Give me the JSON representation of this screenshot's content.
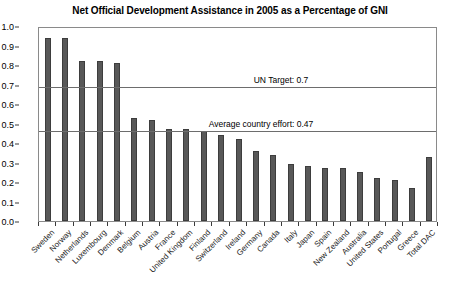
{
  "chart_data": {
    "type": "bar",
    "title": "Net Official Development Assistance in 2005 as a Percentage of GNI",
    "xlabel": "",
    "ylabel": "",
    "ylim": [
      0.0,
      1.0
    ],
    "grid": false,
    "legend": null,
    "categories": [
      "Sweden",
      "Norway",
      "Netherlands",
      "Luxembourg",
      "Denmark",
      "Belgium",
      "Austria",
      "France",
      "United Kingdom",
      "Finland",
      "Switzerland",
      "Ireland",
      "Germany",
      "Canada",
      "Italy",
      "Japan",
      "Spain",
      "New Zealand",
      "Australia",
      "United States",
      "Portugal",
      "Greece",
      "Total DAC"
    ],
    "values": [
      0.94,
      0.94,
      0.82,
      0.82,
      0.81,
      0.53,
      0.52,
      0.47,
      0.47,
      0.46,
      0.44,
      0.42,
      0.36,
      0.34,
      0.29,
      0.28,
      0.27,
      0.27,
      0.25,
      0.22,
      0.21,
      0.17,
      0.33
    ],
    "ytick_labels": [
      "1.0",
      "0.9",
      "0.8",
      "0.7",
      "0.6",
      "0.5",
      "0.4",
      "0.3",
      "0.2",
      "0.1",
      "0.0"
    ],
    "ytick_values": [
      1.0,
      0.9,
      0.8,
      0.7,
      0.6,
      0.5,
      0.4,
      0.3,
      0.2,
      0.1,
      0.0
    ],
    "annotations": [
      {
        "label": "UN Target: 0.7",
        "value": 0.7
      },
      {
        "label": "Average country effort: 0.47",
        "value": 0.47
      }
    ],
    "colors": {
      "bar": "#585858",
      "bar_edge": "#3d3d3d",
      "frame": "#8a8a8a",
      "reference_line": "#6d6d6d",
      "text": "#000000",
      "background": "#ffffff"
    }
  }
}
